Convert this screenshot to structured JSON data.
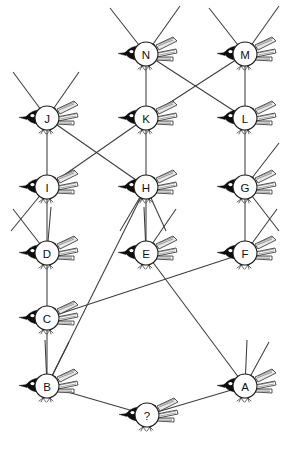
{
  "diagram": {
    "type": "node-link-graph",
    "background_color": "#ffffff",
    "edge_color": "#3c3c3c",
    "node_fill": "#ffffff",
    "node_stroke": "#1d1d1d",
    "bird_ink_color": "#0d0d0d",
    "node_radius": 12,
    "nodes": [
      {
        "id": "A",
        "label": "A",
        "x": 245,
        "y": 386
      },
      {
        "id": "B",
        "label": "B",
        "x": 47,
        "y": 386
      },
      {
        "id": "C",
        "label": "C",
        "x": 47,
        "y": 318
      },
      {
        "id": "D",
        "label": "D",
        "x": 47,
        "y": 253
      },
      {
        "id": "E",
        "label": "E",
        "x": 146,
        "y": 253
      },
      {
        "id": "F",
        "label": "F",
        "x": 245,
        "y": 253
      },
      {
        "id": "G",
        "label": "G",
        "x": 245,
        "y": 187
      },
      {
        "id": "H",
        "label": "H",
        "x": 146,
        "y": 187
      },
      {
        "id": "I",
        "label": "I",
        "x": 47,
        "y": 187
      },
      {
        "id": "J",
        "label": "J",
        "x": 47,
        "y": 118
      },
      {
        "id": "K",
        "label": "K",
        "x": 146,
        "y": 118
      },
      {
        "id": "L",
        "label": "L",
        "x": 245,
        "y": 118
      },
      {
        "id": "M",
        "label": "M",
        "x": 245,
        "y": 54
      },
      {
        "id": "N",
        "label": "N",
        "x": 146,
        "y": 54
      },
      {
        "id": "Q",
        "label": "?",
        "x": 147,
        "y": 415
      }
    ],
    "edges": [
      {
        "from": "N",
        "to": "K"
      },
      {
        "from": "M",
        "to": "L"
      },
      {
        "from": "N",
        "to": "L"
      },
      {
        "from": "M",
        "to": "K"
      },
      {
        "from": "K",
        "to": "H"
      },
      {
        "from": "J",
        "to": "I"
      },
      {
        "from": "J",
        "to": "H"
      },
      {
        "from": "K",
        "to": "I"
      },
      {
        "from": "L",
        "to": "G"
      },
      {
        "from": "I",
        "to": "D"
      },
      {
        "from": "H",
        "to": "E"
      },
      {
        "from": "G",
        "to": "F"
      },
      {
        "from": "D",
        "to": "C"
      },
      {
        "from": "C",
        "to": "B"
      },
      {
        "from": "C",
        "to": "F"
      },
      {
        "from": "H",
        "to": "B"
      },
      {
        "from": "E",
        "to": "A"
      },
      {
        "from": "B",
        "to": "Q"
      },
      {
        "from": "Q",
        "to": "A"
      }
    ],
    "dangling_stubs": [
      {
        "node": "N",
        "dx": -36,
        "dy": -46
      },
      {
        "node": "N",
        "dx": 34,
        "dy": -48
      },
      {
        "node": "M",
        "dx": -36,
        "dy": -46
      },
      {
        "node": "M",
        "dx": 34,
        "dy": -48
      },
      {
        "node": "J",
        "dx": -34,
        "dy": -46
      },
      {
        "node": "J",
        "dx": 32,
        "dy": -46
      },
      {
        "node": "I",
        "dx": -36,
        "dy": 44
      },
      {
        "node": "G",
        "dx": 34,
        "dy": -44
      },
      {
        "node": "G",
        "dx": 34,
        "dy": 44
      },
      {
        "node": "D",
        "dx": -34,
        "dy": -44
      },
      {
        "node": "D",
        "dx": 4,
        "dy": -46
      },
      {
        "node": "E",
        "dx": -2,
        "dy": -46
      },
      {
        "node": "E",
        "dx": 30,
        "dy": -44
      },
      {
        "node": "F",
        "dx": 32,
        "dy": -44
      },
      {
        "node": "B",
        "dx": -2,
        "dy": -46
      },
      {
        "node": "B",
        "dx": 22,
        "dy": -44
      },
      {
        "node": "A",
        "dx": 2,
        "dy": -46
      },
      {
        "node": "A",
        "dx": 24,
        "dy": -44
      },
      {
        "node": "H",
        "dx": -26,
        "dy": 44
      },
      {
        "node": "H",
        "dx": 20,
        "dy": 44
      }
    ]
  }
}
